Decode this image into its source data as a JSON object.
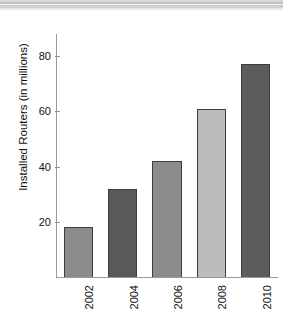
{
  "page": {
    "background_color": "#ffffff",
    "top_rules": [
      "#d9d9d9",
      "#c2c2c2",
      "#efefef",
      "#cfcfcf",
      "#e8e8e8"
    ]
  },
  "chart_data": {
    "type": "bar",
    "title": "",
    "subtitle": "",
    "xlabel": "",
    "ylabel": "Installed Routers (in millions)",
    "categories": [
      "2002",
      "2004",
      "2006",
      "2008",
      "2010"
    ],
    "values": [
      18,
      32,
      42,
      61,
      77
    ],
    "bar_colors": [
      "#8c8c8c",
      "#595959",
      "#8c8c8c",
      "#bcbcbc",
      "#5c5c5c"
    ],
    "bar_edge_color": "#3d3d3d",
    "ylim": [
      0,
      88
    ],
    "yticks": [
      20,
      40,
      60,
      80
    ],
    "ytick_labels": [
      "20",
      "40",
      "60",
      "80"
    ],
    "xtick_rotation": -90,
    "ytick_rotation": 0,
    "grid": false,
    "legend": false,
    "axis_color": "#9a9a9a",
    "series": [
      {
        "name": "Installed Routers",
        "values": [
          18,
          32,
          42,
          61,
          77
        ]
      }
    ]
  }
}
